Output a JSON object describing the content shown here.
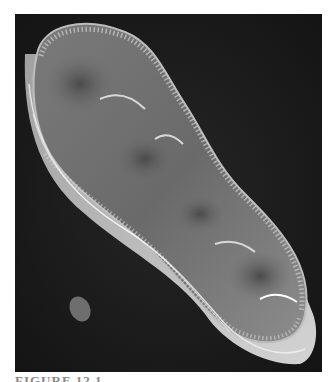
{
  "figure": {
    "background_color": "#1a1a1a",
    "specimen_color": "#8a8a8a",
    "highlight_color": "#e6e6e6",
    "caption_partial": "FIGURE 12.1"
  }
}
